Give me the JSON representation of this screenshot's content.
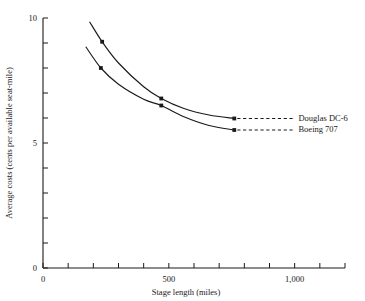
{
  "chart_data": {
    "type": "line",
    "title": "",
    "xlabel": "Stage length (miles)",
    "ylabel": "Average costs (cents per available seat-mile)",
    "xlim": [
      0,
      1200
    ],
    "ylim": [
      0,
      10
    ],
    "grid": false,
    "legend_position": "right",
    "x_ticks": [
      0,
      100,
      200,
      300,
      400,
      500,
      600,
      700,
      800,
      900,
      1000,
      1100,
      1200
    ],
    "x_tick_labels": [
      {
        "value": 0,
        "label": "0"
      },
      {
        "value": 500,
        "label": "500"
      },
      {
        "value": 1000,
        "label": "1,000"
      }
    ],
    "y_ticks": [
      0,
      1,
      2,
      3,
      4,
      5,
      6,
      7,
      8,
      9,
      10
    ],
    "y_tick_labels": [
      {
        "value": 0,
        "label": "0"
      },
      {
        "value": 5,
        "label": "5"
      },
      {
        "value": 10,
        "label": "10"
      }
    ],
    "series": [
      {
        "name": "Douglas DC-6",
        "label_text": "Douglas DC-6",
        "color": "#1a1a1a",
        "points": [
          {
            "x": 185,
            "y": 9.85
          },
          {
            "x": 235,
            "y": 9.05
          },
          {
            "x": 300,
            "y": 8.2
          },
          {
            "x": 400,
            "y": 7.25
          },
          {
            "x": 470,
            "y": 6.78
          },
          {
            "x": 560,
            "y": 6.38
          },
          {
            "x": 660,
            "y": 6.12
          },
          {
            "x": 760,
            "y": 5.98
          }
        ],
        "markers": [
          {
            "x": 235,
            "y": 9.05
          },
          {
            "x": 470,
            "y": 6.78
          },
          {
            "x": 760,
            "y": 5.98
          }
        ],
        "leader_end_x": 1000
      },
      {
        "name": "Boeing 707",
        "label_text": "Boeing 707",
        "color": "#1a1a1a",
        "points": [
          {
            "x": 170,
            "y": 8.85
          },
          {
            "x": 230,
            "y": 8.0
          },
          {
            "x": 300,
            "y": 7.35
          },
          {
            "x": 400,
            "y": 6.75
          },
          {
            "x": 470,
            "y": 6.5
          },
          {
            "x": 560,
            "y": 6.05
          },
          {
            "x": 660,
            "y": 5.7
          },
          {
            "x": 760,
            "y": 5.52
          }
        ],
        "markers": [
          {
            "x": 230,
            "y": 8.0
          },
          {
            "x": 470,
            "y": 6.5
          },
          {
            "x": 760,
            "y": 5.52
          }
        ],
        "leader_end_x": 1000
      }
    ],
    "annotations": [
      {
        "text": "Douglas DC-6",
        "at_x": 1015,
        "at_y": 5.98
      },
      {
        "text": "Boeing 707",
        "at_x": 1015,
        "at_y": 5.52
      }
    ]
  }
}
